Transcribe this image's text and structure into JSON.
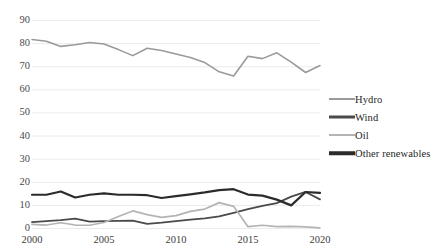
{
  "chart_data": {
    "type": "line",
    "title": "",
    "xlabel": "",
    "ylabel": "",
    "x": [
      2000,
      2001,
      2002,
      2003,
      2004,
      2005,
      2006,
      2007,
      2008,
      2009,
      2010,
      2011,
      2012,
      2013,
      2014,
      2015,
      2016,
      2017,
      2018,
      2019,
      2020
    ],
    "xlim": [
      2000,
      2020
    ],
    "ylim": [
      0,
      90
    ],
    "xticks": [
      2000,
      2005,
      2010,
      2015,
      2020
    ],
    "xtick_labels": [
      "2000",
      "2005",
      "2010",
      "2015",
      "2020"
    ],
    "yticks": [
      0,
      10,
      20,
      30,
      40,
      50,
      60,
      70,
      80,
      90
    ],
    "ytick_labels": [
      "0",
      "10",
      "20",
      "30",
      "40",
      "50",
      "60",
      "70",
      "80",
      "90"
    ],
    "grid": "horizontal",
    "legend_position": "right",
    "series": [
      {
        "name": "Hydro",
        "color": "#9a9a9a",
        "width": 1.6,
        "values": [
          81.8,
          81.0,
          78.8,
          79.5,
          80.5,
          79.8,
          77.4,
          74.8,
          78.0,
          77.0,
          75.5,
          74.0,
          71.8,
          67.8,
          66.0,
          74.5,
          73.5,
          76.0,
          72.0,
          67.5,
          70.5
        ]
      },
      {
        "name": "Wind",
        "color": "#4a4a4a",
        "width": 1.8,
        "values": [
          2.8,
          3.2,
          3.6,
          4.3,
          3.0,
          3.2,
          3.3,
          3.4,
          2.0,
          2.5,
          3.2,
          3.8,
          4.4,
          5.2,
          6.8,
          8.4,
          9.8,
          11.0,
          13.8,
          15.8,
          12.6
        ]
      },
      {
        "name": "Oil",
        "color": "#b4b4b4",
        "width": 1.7,
        "values": [
          1.8,
          1.5,
          2.5,
          1.5,
          1.4,
          2.6,
          5.2,
          7.6,
          6.0,
          4.8,
          5.6,
          7.4,
          8.4,
          11.2,
          9.6,
          0.8,
          1.4,
          0.8,
          0.9,
          0.7,
          0.3
        ]
      },
      {
        "name": "Other renewables",
        "color": "#2b2b2b",
        "width": 2.2,
        "values": [
          14.6,
          14.6,
          16.0,
          13.4,
          14.6,
          15.2,
          14.6,
          14.6,
          14.4,
          13.2,
          14.0,
          14.8,
          15.6,
          16.6,
          17.0,
          14.7,
          14.2,
          12.5,
          10.0,
          15.8,
          15.4
        ]
      }
    ]
  },
  "legend": {
    "items": [
      {
        "label": "Hydro",
        "color": "#9a9a9a",
        "thickness": 2
      },
      {
        "label": "Wind",
        "color": "#4a4a4a",
        "thickness": 3
      },
      {
        "label": "Oil",
        "color": "#b4b4b4",
        "thickness": 2
      },
      {
        "label": "Other renewables",
        "color": "#2b2b2b",
        "thickness": 3.5
      }
    ]
  },
  "grid_color": "#ebebeb",
  "background": "#ffffff"
}
